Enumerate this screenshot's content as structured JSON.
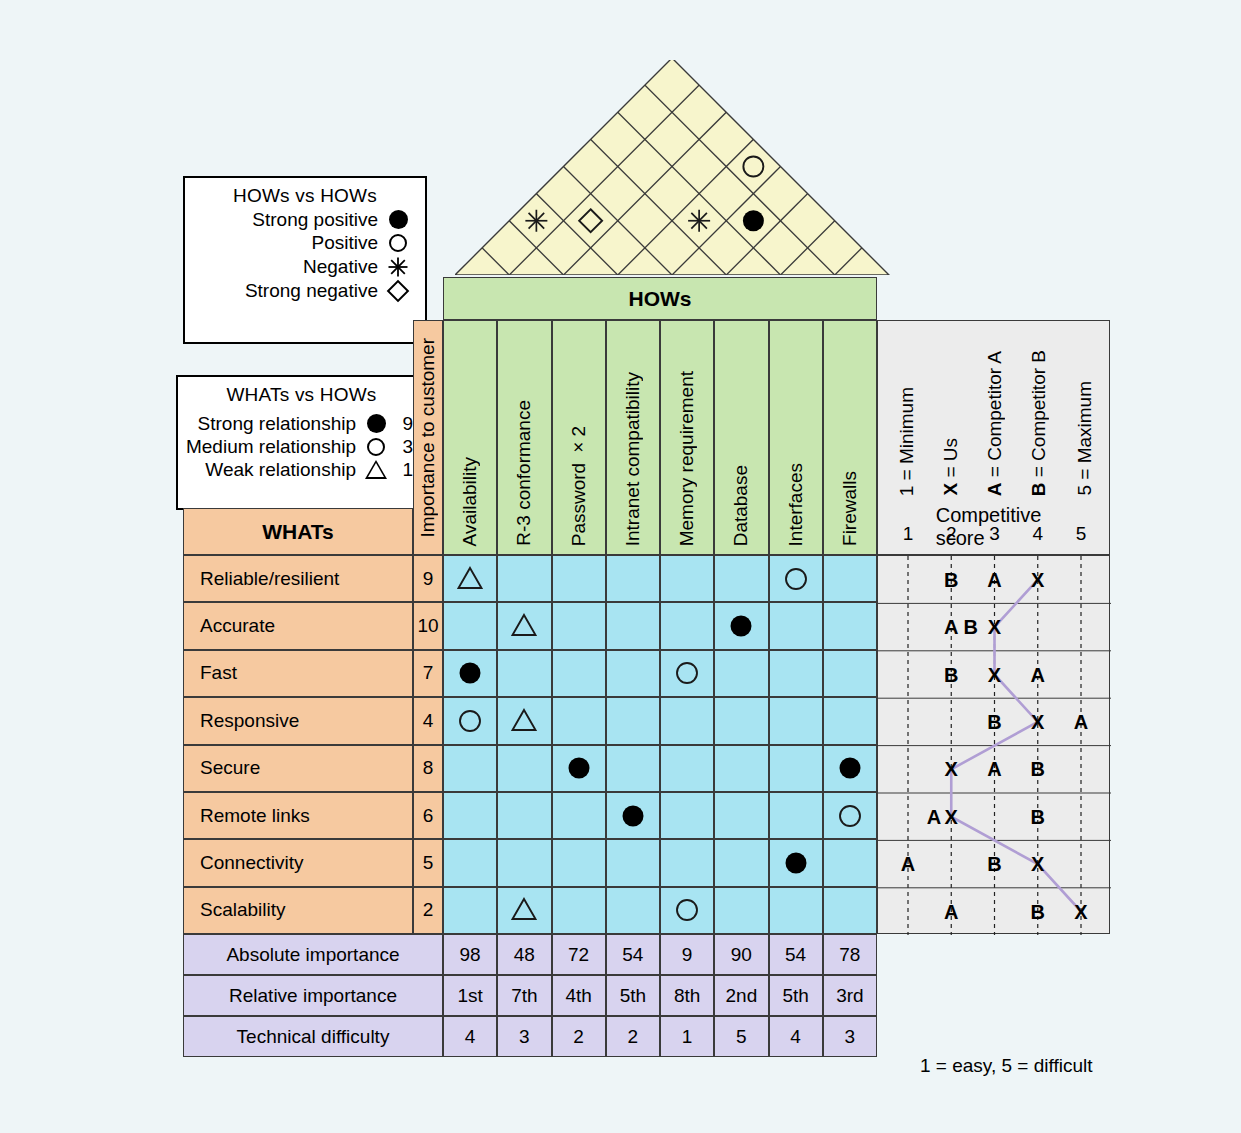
{
  "legend_hows": {
    "title": "HOWs vs HOWs",
    "rows": [
      {
        "label": "Strong positive",
        "symbol": "filled-circle-icon"
      },
      {
        "label": "Positive",
        "symbol": "open-circle-icon"
      },
      {
        "label": "Negative",
        "symbol": "asterisk-icon"
      },
      {
        "label": "Strong negative",
        "symbol": "open-diamond-icon"
      }
    ]
  },
  "legend_whats": {
    "title": "WHATs vs HOWs",
    "rows": [
      {
        "label": "Strong relationship",
        "symbol": "filled-circle-icon",
        "value": "9"
      },
      {
        "label": "Medium relationship",
        "symbol": "open-circle-icon",
        "value": "3"
      },
      {
        "label": "Weak relationship",
        "symbol": "open-triangle-icon",
        "value": "1"
      }
    ]
  },
  "headers": {
    "hows_banner": "HOWs",
    "whats": "WHATs",
    "importance": "Importance to customer",
    "hows": [
      "Availability",
      "R-3 conformance",
      "Password ×2",
      "Intranet compatibility",
      "Memory requirement",
      "Database",
      "Interfaces",
      "Firewalls"
    ]
  },
  "competitive": {
    "legend": [
      "1 = Minimum",
      "X = Us",
      "A = Competitor A",
      "B = Competitor B",
      "5 = Maximum"
    ],
    "title": "Competitive score",
    "axis": [
      "1",
      "2",
      "3",
      "4",
      "5"
    ],
    "rows": [
      {
        "X": 4,
        "A": 3,
        "B": 2
      },
      {
        "X": 3,
        "A": 2,
        "B": 2.45
      },
      {
        "X": 3,
        "A": 4,
        "B": 2
      },
      {
        "X": 4,
        "A": 5,
        "B": 3
      },
      {
        "X": 2,
        "A": 3,
        "B": 4
      },
      {
        "X": 2,
        "A": 1.6,
        "B": 4
      },
      {
        "X": 4,
        "A": 1,
        "B": 3
      },
      {
        "X": 5,
        "A": 2,
        "B": 4
      }
    ]
  },
  "whats": [
    {
      "name": "Reliable/resilient",
      "importance": "9",
      "rel": [
        1,
        0,
        0,
        0,
        0,
        0,
        3,
        0
      ]
    },
    {
      "name": "Accurate",
      "importance": "10",
      "rel": [
        0,
        1,
        0,
        0,
        0,
        9,
        0,
        0
      ]
    },
    {
      "name": "Fast",
      "importance": "7",
      "rel": [
        9,
        0,
        0,
        0,
        3,
        0,
        0,
        0
      ]
    },
    {
      "name": "Responsive",
      "importance": "4",
      "rel": [
        3,
        1,
        0,
        0,
        0,
        0,
        0,
        0
      ]
    },
    {
      "name": "Secure",
      "importance": "8",
      "rel": [
        0,
        0,
        9,
        0,
        0,
        0,
        0,
        9
      ]
    },
    {
      "name": "Remote links",
      "importance": "6",
      "rel": [
        0,
        0,
        0,
        9,
        0,
        0,
        0,
        3
      ]
    },
    {
      "name": "Connectivity",
      "importance": "5",
      "rel": [
        0,
        0,
        0,
        0,
        0,
        0,
        9,
        0
      ]
    },
    {
      "name": "Scalability",
      "importance": "2",
      "rel": [
        0,
        1,
        0,
        0,
        3,
        0,
        0,
        0
      ]
    }
  ],
  "summary": [
    {
      "label": "Absolute importance",
      "values": [
        "98",
        "48",
        "72",
        "54",
        "9",
        "90",
        "54",
        "78"
      ]
    },
    {
      "label": "Relative importance",
      "values": [
        "1st",
        "7th",
        "4th",
        "5th",
        "8th",
        "2nd",
        "5th",
        "3rd"
      ]
    },
    {
      "label": "Technical difficulty",
      "values": [
        "4",
        "3",
        "2",
        "2",
        "1",
        "5",
        "4",
        "3"
      ]
    }
  ],
  "difficulty_note": "1 = easy, 5 = difficult",
  "roof": {
    "correlations": [
      {
        "a": 0,
        "b": 2,
        "symbol": "asterisk-icon"
      },
      {
        "a": 1,
        "b": 3,
        "symbol": "open-diamond-icon"
      },
      {
        "a": 3,
        "b": 7,
        "symbol": "open-circle-icon"
      },
      {
        "a": 4,
        "b": 6,
        "symbol": "filled-circle-icon"
      },
      {
        "a": 3,
        "b": 5,
        "symbol": "asterisk-icon"
      }
    ]
  },
  "colors": {
    "background": "#eef5f7",
    "hows_green": "#c8e6b0",
    "whats_orange": "#f6c9a0",
    "relationship_blue": "#a8e4f2",
    "summary_purple": "#d8d3ef",
    "roof_yellow": "#f7f5cc",
    "competitive_gray": "#ececec",
    "score_line": "#b09ed4"
  }
}
